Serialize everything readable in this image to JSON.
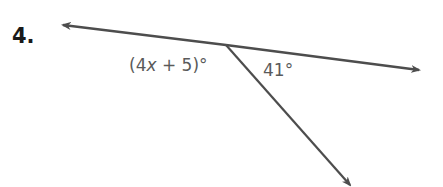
{
  "problem": {
    "number": "4."
  },
  "figure": {
    "type": "linear pair of angles",
    "line": {
      "from": [
        62,
        25
      ],
      "vertex": [
        226,
        45
      ],
      "to": [
        420,
        70
      ],
      "arrows": "both"
    },
    "ray": {
      "from": [
        226,
        45
      ],
      "to": [
        352,
        187
      ],
      "arrow": "end"
    },
    "stroke_color": "#4d4d4d"
  },
  "angles": {
    "left": {
      "open": "(4",
      "variable": "x",
      "rest": " + 5)°",
      "full": "(4x + 5)°"
    },
    "right": {
      "label": "41°"
    }
  }
}
